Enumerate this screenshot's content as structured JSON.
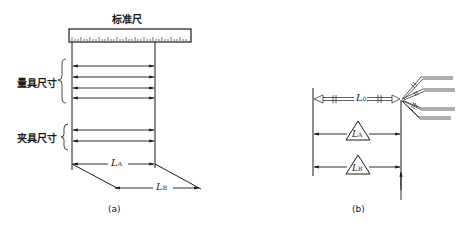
{
  "figure_a": {
    "ruler_label": "标准尺",
    "gauge_size_label": "量具尺寸",
    "fixture_size_label": "夹具尺寸",
    "dim_LA": {
      "main": "L",
      "sub": "A"
    },
    "dim_LB": {
      "main": "L",
      "sub": "B"
    },
    "caption": "(a)"
  },
  "figure_b": {
    "dim_L0": {
      "main": "L",
      "sub": "0"
    },
    "dim_LA": {
      "main": "L",
      "sub": "A"
    },
    "dim_LB": {
      "main": "L",
      "sub": "B"
    },
    "caption": "(b)"
  }
}
